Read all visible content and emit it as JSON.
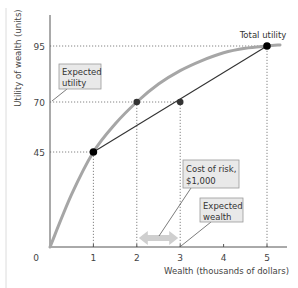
{
  "chart_data": {
    "type": "line",
    "title": "",
    "xlabel": "Wealth (thousands of dollars)",
    "ylabel": "Utility of wealth (units)",
    "xlim": [
      0,
      5.3
    ],
    "ylim": [
      0,
      100
    ],
    "x_ticks": [
      0,
      1,
      2,
      3,
      4,
      5
    ],
    "y_ticks": [
      45,
      70,
      95
    ],
    "grid": false,
    "series": [
      {
        "name": "Total utility",
        "style": "curve",
        "color": "#a6a6a6",
        "x": [
          0,
          0.5,
          1,
          1.5,
          2,
          2.5,
          3,
          3.5,
          4,
          4.5,
          5,
          5.3
        ],
        "y": [
          0,
          25,
          45,
          59,
          70,
          78,
          84,
          88.5,
          92,
          94,
          95,
          95.5
        ]
      },
      {
        "name": "Expected utility line",
        "style": "straight",
        "color": "#333333",
        "x": [
          1,
          5
        ],
        "y": [
          45,
          95
        ]
      }
    ],
    "points": [
      {
        "x": 1,
        "y": 45,
        "label": ""
      },
      {
        "x": 2,
        "y": 70,
        "label": ""
      },
      {
        "x": 3,
        "y": 70,
        "label": ""
      },
      {
        "x": 5,
        "y": 95,
        "label": "Total utility"
      }
    ],
    "reference_lines": [
      {
        "from": [
          0,
          95
        ],
        "to": [
          5,
          95
        ]
      },
      {
        "from": [
          0,
          70
        ],
        "to": [
          3,
          70
        ]
      },
      {
        "from": [
          0,
          45
        ],
        "to": [
          1,
          45
        ]
      },
      {
        "from": [
          1,
          0
        ],
        "to": [
          1,
          45
        ]
      },
      {
        "from": [
          2,
          0
        ],
        "to": [
          2,
          70
        ]
      },
      {
        "from": [
          3,
          0
        ],
        "to": [
          3,
          70
        ]
      },
      {
        "from": [
          5,
          0
        ],
        "to": [
          5,
          95
        ]
      }
    ],
    "annotations": [
      {
        "text": [
          "Expected",
          "utility"
        ],
        "points_to": [
          0,
          70
        ]
      },
      {
        "text": [
          "Cost of risk,",
          "$1,000"
        ],
        "points_to": [
          2.5,
          0.3
        ]
      },
      {
        "text": [
          "Expected",
          "wealth"
        ],
        "points_to": [
          3,
          0
        ]
      },
      {
        "text": [
          "Total utility"
        ],
        "points_to": [
          5,
          95
        ]
      }
    ],
    "arrow": {
      "from": 2,
      "to": 3,
      "label": "Cost of risk, $1,000"
    }
  },
  "labels": {
    "total_utility": "Total utility",
    "expected_utility_1": "Expected",
    "expected_utility_2": "utility",
    "cost_of_risk_1": "Cost of risk,",
    "cost_of_risk_2": "$1,000",
    "expected_wealth_1": "Expected",
    "expected_wealth_2": "wealth",
    "x_title": "Wealth (thousands of dollars)",
    "y_title": "Utility of wealth (units)"
  },
  "tick_labels": {
    "x": [
      "0",
      "1",
      "2",
      "3",
      "4",
      "5"
    ],
    "y": [
      "45",
      "70",
      "95"
    ]
  }
}
